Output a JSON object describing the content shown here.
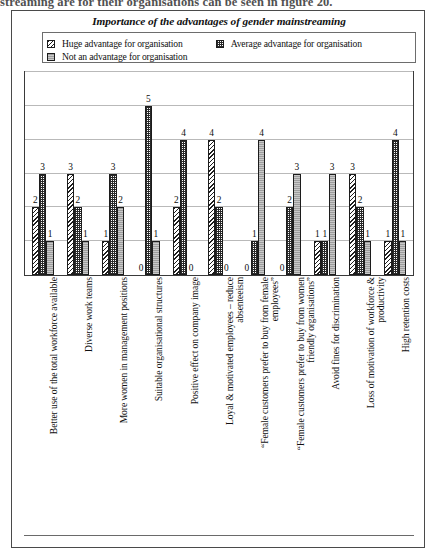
{
  "page": {
    "cut_off_text": "streaming are for their organisations can be seen in figure 20."
  },
  "chart_data": {
    "type": "bar",
    "title": "Importance of the advantages of gender mainstreaming",
    "xlabel": "",
    "ylabel": "",
    "ylim": [
      0,
      6
    ],
    "ytick_step": 1,
    "grid": true,
    "grouping": "grouped",
    "legend_position": "top",
    "bar_patterns": [
      "diagonal-hatch",
      "checkerboard",
      "solid-gray"
    ],
    "categories": [
      "Better use of the total workforce available",
      "Diverse work teams",
      "More women in management positions",
      "Suitable organisational structures",
      "Positive effect on company image",
      "Loyal & motivated employees – reduce\nabsenteeism",
      "“Female customers prefer to buy from female\nemployees”",
      "“Female customers prefer to buy from women\nfriendly organisations”",
      "Avoid fines for discrimination",
      "Loss of motivation of workforce &\nproductivity",
      "High retention costs"
    ],
    "series": [
      {
        "name": "Huge advantage for organisation",
        "pattern": "diagonal-hatch",
        "values": [
          2,
          3,
          1,
          0,
          2,
          4,
          0,
          0,
          1,
          3,
          1
        ]
      },
      {
        "name": "Average advantage for organisation",
        "pattern": "checkerboard",
        "values": [
          3,
          2,
          3,
          5,
          4,
          2,
          1,
          2,
          1,
          2,
          4
        ]
      },
      {
        "name": "Not an advantage for organisation",
        "pattern": "solid-gray",
        "values": [
          1,
          1,
          2,
          1,
          0,
          0,
          4,
          3,
          3,
          1,
          1
        ]
      }
    ]
  },
  "colors": {
    "frame": "#3a3a3a",
    "gridline": "#b9b9b9",
    "bar_outline": "#1c1c1c",
    "solid_gray_fill": "#9d9d9d",
    "text": "#101010",
    "page_background": "#ffffff"
  }
}
